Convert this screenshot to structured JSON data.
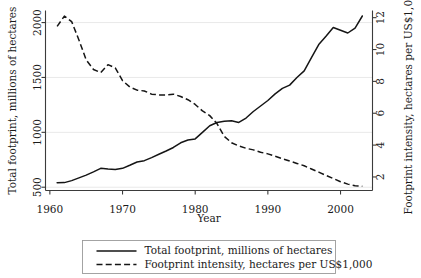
{
  "chart_data": {
    "type": "line",
    "title": "",
    "xlabel": "Year",
    "ylabel": "Total footprint, millions of hectares",
    "y2label": "Footprint intensity, hectares per US$1,000",
    "xlim": [
      1959.4,
      2004.4
    ],
    "ylim": [
      470,
      2110
    ],
    "y2lim": [
      1.15,
      12.45
    ],
    "xticks": [
      1960,
      1970,
      1980,
      1990,
      2000
    ],
    "xticklabels": [
      "1960",
      "1970",
      "1980",
      "1990",
      "2000"
    ],
    "yticks": [
      500,
      1000,
      1500,
      2000
    ],
    "yticklabels": [
      "500",
      "1000",
      "1500",
      "2000"
    ],
    "y2ticks": [
      2,
      4,
      6,
      8,
      10,
      12
    ],
    "y2ticklabels": [
      "2",
      "4",
      "6",
      "8",
      "10",
      "12"
    ],
    "grid": "horizontal",
    "gridcolor": "#e9e9e9",
    "legend_position": "below",
    "series": [
      {
        "name": "Total footprint, millions of hectares",
        "axis": "left",
        "style": "solid",
        "color": "#151515",
        "x": [
          1961,
          1962,
          1963,
          1964,
          1965,
          1966,
          1967,
          1968,
          1969,
          1970,
          1971,
          1972,
          1973,
          1974,
          1975,
          1976,
          1977,
          1978,
          1979,
          1980,
          1981,
          1982,
          1983,
          1984,
          1985,
          1986,
          1987,
          1988,
          1989,
          1990,
          1991,
          1992,
          1993,
          1994,
          1995,
          1996,
          1997,
          1998,
          1999,
          2000,
          2001,
          2002,
          2003
        ],
        "y": [
          540,
          542,
          560,
          585,
          610,
          640,
          672,
          665,
          662,
          672,
          700,
          730,
          742,
          770,
          800,
          830,
          862,
          905,
          930,
          940,
          1000,
          1060,
          1090,
          1100,
          1105,
          1090,
          1130,
          1190,
          1240,
          1290,
          1350,
          1400,
          1430,
          1440,
          1500,
          1505,
          1510,
          1600,
          1670,
          1750,
          1870,
          1960,
          1950
        ],
        "y_note": "continues 1994-2003 per traced path",
        "y_full": [
          540,
          542,
          560,
          585,
          610,
          640,
          672,
          665,
          662,
          672,
          700,
          730,
          742,
          770,
          800,
          830,
          862,
          905,
          930,
          940,
          1000,
          1060,
          1090,
          1100,
          1105,
          1090,
          1130,
          1190,
          1240,
          1290,
          1350,
          1400,
          1430,
          1500,
          1560,
          1680,
          1800,
          1875,
          1955,
          1930,
          1905,
          1950,
          2060
        ]
      },
      {
        "name": "Footprint intensity, hectares per US$1,000",
        "axis": "right",
        "style": "dashed",
        "color": "#151515",
        "x": [
          1961,
          1962,
          1963,
          1964,
          1965,
          1966,
          1967,
          1968,
          1969,
          1970,
          1971,
          1972,
          1973,
          1974,
          1975,
          1976,
          1977,
          1978,
          1979,
          1980,
          1981,
          1982,
          1983,
          1984,
          1985,
          1986,
          1987,
          1988,
          1989,
          1990,
          1991,
          1992,
          1993,
          1994,
          1995,
          1996,
          1997,
          1998,
          1999,
          2000,
          2001,
          2002,
          2003
        ],
        "y": [
          11.45,
          12.1,
          11.75,
          10.6,
          9.35,
          8.75,
          8.55,
          9.05,
          8.85,
          8.05,
          7.65,
          7.45,
          7.4,
          7.2,
          7.15,
          7.15,
          7.2,
          7.05,
          6.85,
          6.55,
          6.15,
          5.85,
          5.35,
          4.55,
          4.15,
          3.95,
          3.8,
          3.7,
          3.55,
          3.45,
          3.3,
          3.15,
          3.0,
          2.85,
          2.7,
          2.5,
          2.3,
          2.1,
          1.9,
          1.7,
          1.55,
          1.45,
          1.42
        ]
      }
    ],
    "legend": [
      {
        "label": "Total footprint, millions of hectares",
        "style": "solid"
      },
      {
        "label": "Footprint intensity, hectares per US$1,000",
        "style": "dashed"
      }
    ]
  }
}
